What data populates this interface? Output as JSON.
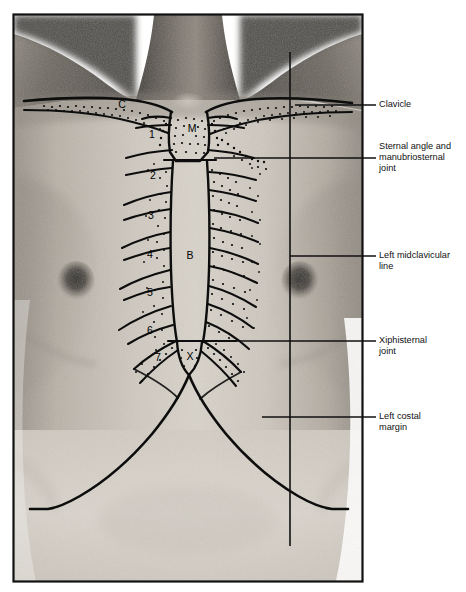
{
  "figure": {
    "frame": {
      "stroke": "#111111",
      "x": 13,
      "y": 14,
      "width": 350,
      "height": 568
    }
  },
  "callouts": [
    {
      "id": "clavicle",
      "lines": [
        "Clavicle"
      ],
      "leader_y": 105,
      "leader_x_start": 295,
      "leader_x_end": 376,
      "text_x": 379,
      "text_y": 105
    },
    {
      "id": "sternal-angle",
      "lines": [
        "Sternal angle and",
        "manubriosternal",
        "joint"
      ],
      "leader_y": 158,
      "leader_x_start": 214,
      "leader_x_end": 376,
      "text_x": 379,
      "text_y": 158
    },
    {
      "id": "left-midclavicular-line",
      "lines": [
        "Left midclavicular",
        "line"
      ],
      "leader_y": 256,
      "leader_x_start": 290,
      "leader_x_end": 376,
      "text_x": 379,
      "text_y": 256
    },
    {
      "id": "xiphisternal-joint",
      "lines": [
        "Xiphisternal",
        "joint"
      ],
      "leader_y": 341,
      "leader_x_start": 208,
      "leader_x_end": 376,
      "text_x": 379,
      "text_y": 341
    },
    {
      "id": "left-costal-margin",
      "lines": [
        "Left costal",
        "margin"
      ],
      "leader_y": 417,
      "leader_x_start": 262,
      "leader_x_end": 376,
      "text_x": 379,
      "text_y": 417
    }
  ],
  "markers": [
    {
      "id": "clavicle-c",
      "label": "C",
      "x": 122,
      "y": 105
    },
    {
      "id": "manubrium-m",
      "label": "M",
      "x": 192,
      "y": 129
    },
    {
      "id": "body-b",
      "label": "B",
      "x": 190,
      "y": 256
    },
    {
      "id": "xiphoid-x",
      "label": "X",
      "x": 190,
      "y": 357
    },
    {
      "id": "rib-1",
      "label": "1",
      "x": 152,
      "y": 135
    },
    {
      "id": "rib-2",
      "label": "2",
      "x": 153,
      "y": 176
    },
    {
      "id": "rib-3",
      "label": "3",
      "x": 151,
      "y": 216
    },
    {
      "id": "rib-4",
      "label": "4",
      "x": 150,
      "y": 255
    },
    {
      "id": "rib-5",
      "label": "5",
      "x": 150,
      "y": 293
    },
    {
      "id": "rib-6",
      "label": "6",
      "x": 150,
      "y": 331
    },
    {
      "id": "rib-7",
      "label": "7",
      "x": 158,
      "y": 358
    }
  ],
  "guides": {
    "midclavicular_vertical": {
      "x": 290,
      "y_top": 52,
      "y_bottom": 546
    }
  },
  "colors": {
    "ink": "#111111",
    "skin_light": "#d7d2ca",
    "skin_mid": "#b4ada3",
    "skin_dark": "#6f6a62",
    "neck_shadow": "#4a4640",
    "background": "#ffffff"
  }
}
